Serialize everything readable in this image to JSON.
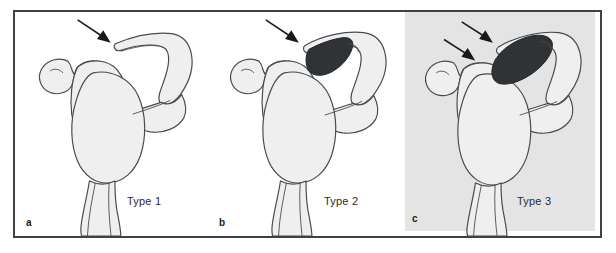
{
  "figure": {
    "name": "acromion-morphology-types",
    "border_color": "#3f3f46",
    "background": "#ffffff"
  },
  "panels": [
    {
      "letter": "a",
      "type_label": "Type 1",
      "background": "#ffffff",
      "arrow_count": 1,
      "spur": false,
      "spur_color": "#2f3336",
      "description": "flat acromion"
    },
    {
      "letter": "b",
      "type_label": "Type 2",
      "background": "#ffffff",
      "arrow_count": 1,
      "spur": true,
      "spur_color": "#2f3336",
      "description": "curved acromion with small anterior spur"
    },
    {
      "letter": "c",
      "type_label": "Type 3",
      "background": "#e4e4e4",
      "arrow_count": 2,
      "spur": true,
      "spur_color": "#2f3336",
      "description": "hooked acromion with large anterior spur"
    }
  ],
  "colors": {
    "bone_fill": "#efefef",
    "bone_fill_shade": "#e2e2e2",
    "bone_outline": "#4a4a4a",
    "spur_dark": "#2f3336",
    "panel_grey": "#e4e4e4",
    "frame": "#3f3f46",
    "text": "#2b2b2b"
  },
  "icons": {
    "arrow": "arrow-pointer-icon"
  }
}
